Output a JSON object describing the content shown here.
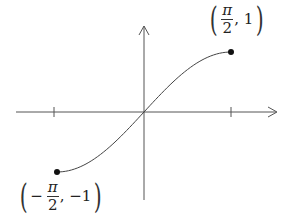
{
  "chart_data": {
    "type": "line",
    "title": "",
    "xlabel": "",
    "ylabel": "",
    "function": "y = sin(x)",
    "domain": [
      -1.5708,
      1.5708
    ],
    "xlim": [
      -1.8,
      2.1
    ],
    "ylim": [
      -1.4,
      1.4
    ],
    "grid": false,
    "x_ticks": [
      -1.5708,
      1.5708
    ],
    "x_tick_labels": [
      "",
      ""
    ],
    "series": [
      {
        "name": "sin(x)",
        "x": [
          -1.5708,
          -1.1781,
          -0.7854,
          -0.3927,
          0,
          0.3927,
          0.7854,
          1.1781,
          1.5708
        ],
        "y": [
          -1,
          -0.9239,
          -0.7071,
          -0.3827,
          0,
          0.3827,
          0.7071,
          0.9239,
          1
        ]
      }
    ],
    "endpoints": [
      {
        "x": -1.5708,
        "y": -1,
        "filled": true
      },
      {
        "x": 1.5708,
        "y": 1,
        "filled": true
      }
    ],
    "annotations": [
      {
        "text": "(π/2, 1)",
        "x": 1.5708,
        "y": 1
      },
      {
        "text": "(−π/2, −1)",
        "x": -1.5708,
        "y": -1
      }
    ]
  },
  "labels": {
    "top_right": {
      "open": "(",
      "sign": "",
      "num": "π",
      "den": "2",
      "rest": ", 1",
      "close": ")"
    },
    "bottom_left": {
      "open": "(",
      "sign": "−",
      "num": "π",
      "den": "2",
      "rest": ", −1",
      "close": ")"
    }
  },
  "colors": {
    "axis": "#555555",
    "curve": "#444444",
    "point": "#111111"
  }
}
